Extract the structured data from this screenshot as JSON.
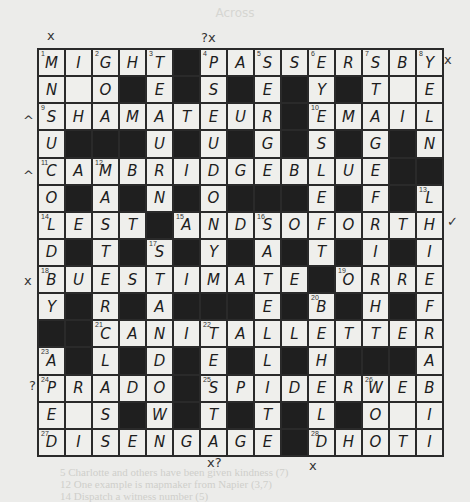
{
  "page": {
    "faint_heading": "Across",
    "footer_lines": [
      "5  Charlotte and others have been given kindness (7)",
      "12  One example is mapmaker from Napier (3,7)",
      "14  Dispatch a witness number (5)"
    ]
  },
  "puzzle": {
    "size": 15,
    "rows": [
      "MIGHT#PASSERSBY",
      "N.O#E#S#E#Y#T.E",
      "SHAMATEUR#EMAIL",
      "U###U#U#G#S#G#N",
      "CAMBRIDGEBLUE##",
      "O#A#N#O###E#F#L",
      "LEST#ANDSOFORTH",
      "D#T#S#Y#A#T#I#I",
      "BUESTIMATE#ORRE",
      "Y#R#A###E#B#H#F",
      "##CANITALLETTER",
      "A#L#D#E#L#H###A",
      "PRADO#SPIDERWEB",
      "E.S#W#T#T#L#O.I",
      "DISENGAGE#DHOTI"
    ],
    "numbers": [
      {
        "n": 1,
        "r": 0,
        "c": 0
      },
      {
        "n": 2,
        "r": 0,
        "c": 2
      },
      {
        "n": 3,
        "r": 0,
        "c": 4
      },
      {
        "n": 4,
        "r": 0,
        "c": 6
      },
      {
        "n": 5,
        "r": 0,
        "c": 8
      },
      {
        "n": 6,
        "r": 0,
        "c": 10
      },
      {
        "n": 7,
        "r": 0,
        "c": 12
      },
      {
        "n": 8,
        "r": 0,
        "c": 14
      },
      {
        "n": 9,
        "r": 2,
        "c": 0
      },
      {
        "n": 10,
        "r": 2,
        "c": 10
      },
      {
        "n": 11,
        "r": 4,
        "c": 0
      },
      {
        "n": 12,
        "r": 4,
        "c": 2
      },
      {
        "n": 13,
        "r": 5,
        "c": 14
      },
      {
        "n": 14,
        "r": 6,
        "c": 0
      },
      {
        "n": 15,
        "r": 6,
        "c": 5
      },
      {
        "n": 16,
        "r": 6,
        "c": 8
      },
      {
        "n": 17,
        "r": 7,
        "c": 4
      },
      {
        "n": 18,
        "r": 8,
        "c": 0
      },
      {
        "n": 19,
        "r": 8,
        "c": 11
      },
      {
        "n": 20,
        "r": 9,
        "c": 10
      },
      {
        "n": 21,
        "r": 10,
        "c": 2
      },
      {
        "n": 22,
        "r": 10,
        "c": 6
      },
      {
        "n": 23,
        "r": 11,
        "c": 0
      },
      {
        "n": 24,
        "r": 12,
        "c": 0
      },
      {
        "n": 25,
        "r": 12,
        "c": 6
      },
      {
        "n": 26,
        "r": 12,
        "c": 12
      },
      {
        "n": 27,
        "r": 14,
        "c": 0
      },
      {
        "n": 28,
        "r": 14,
        "c": 10
      }
    ],
    "answers": {
      "across": [
        "MIGHT",
        "PASSERSBY",
        "SHAMATEUR",
        "EMAIL",
        "CAMBRIDGEBLUE",
        "LEST",
        "ANDSOFORTH",
        "BUESTIMATE",
        "ORRE",
        "CANITALLETTER",
        "PRADO",
        "SPIDERWEB",
        "DISENGAGE",
        "DHOTI"
      ]
    }
  },
  "annotations": [
    {
      "text": "x",
      "x": 47,
      "y": 28,
      "name": "margin-mark-1-down"
    },
    {
      "text": "?x",
      "x": 201,
      "y": 30,
      "name": "margin-mark-4-down"
    },
    {
      "text": "x",
      "x": 444,
      "y": 52,
      "name": "margin-mark-8-down"
    },
    {
      "text": "^",
      "x": 23,
      "y": 113,
      "name": "margin-mark-9-across"
    },
    {
      "text": "^",
      "x": 23,
      "y": 168,
      "name": "margin-mark-11-across"
    },
    {
      "text": "✓",
      "x": 447,
      "y": 214,
      "name": "margin-mark-16-across"
    },
    {
      "text": "x",
      "x": 24,
      "y": 273,
      "name": "margin-mark-18-across"
    },
    {
      "text": "?",
      "x": 29,
      "y": 378,
      "name": "margin-mark-24-across"
    },
    {
      "text": "x?",
      "x": 207,
      "y": 455,
      "name": "margin-mark-bottom-1"
    },
    {
      "text": "x",
      "x": 309,
      "y": 458,
      "name": "margin-mark-bottom-2"
    }
  ]
}
